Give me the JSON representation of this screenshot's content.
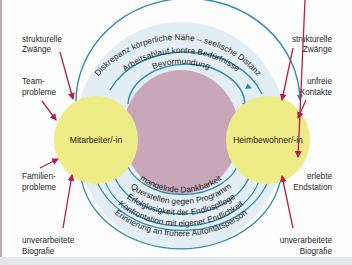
{
  "diagram": {
    "colors": {
      "node_fill": "#eeec86",
      "center_fill": "#c7a7b8",
      "outer_band_fill": "#e3eef4",
      "arc_stroke": "#2f8ab0",
      "red_arrow": "#b81e4f",
      "text": "#2a2a2a"
    },
    "nodes": {
      "left": "Mitarbeiter/-in",
      "right": "Heimbewohner/-in"
    },
    "top_arcs": [
      "Diskrepanz körperliche Nähe – seelische Distanz",
      "Arbeitsablauf kontra Bedürfnisse",
      "Bevormundung"
    ],
    "bottom_arcs": [
      "mangelnde Dankbarkeit",
      "Querstellen gegen Programm",
      "Erfolglosigkeit der Endlospflege",
      "Konfrontation mit eigener Endlichkeit",
      "Erinnerung an frühere Autoritätsperson"
    ],
    "left_factors": [
      {
        "line1": "strukturelle",
        "line2": "Zwänge"
      },
      {
        "line1": "Team-",
        "line2": "probleme"
      },
      {
        "line1": "Familien-",
        "line2": "probleme"
      },
      {
        "line1": "unverarbeitete",
        "line2": "Biografie"
      }
    ],
    "right_factors": [
      {
        "line1": "strukturelle",
        "line2": "Zwänge"
      },
      {
        "line1": "unfreie",
        "line2": "Kontakte"
      },
      {
        "line1": "erlebte",
        "line2": "Endstation"
      },
      {
        "line1": "unverarbeitete",
        "line2": "Biografie"
      }
    ]
  }
}
